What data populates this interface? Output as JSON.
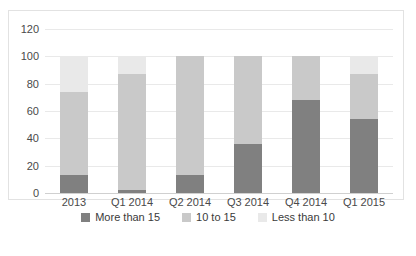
{
  "chart_data": {
    "type": "bar",
    "stacked": true,
    "title": "",
    "subtitle": "",
    "xlabel": "",
    "ylabel": "",
    "categories": [
      "2013",
      "Q1 2014",
      "Q2 2014",
      "Q3 2014",
      "Q4 2014",
      "Q1 2015"
    ],
    "series": [
      {
        "name": "More than 15",
        "color": "#808080",
        "values": [
          13,
          2,
          13,
          36,
          68,
          54
        ]
      },
      {
        "name": "10 to 15",
        "color": "#c9c9c9",
        "values": [
          61,
          85,
          87,
          64,
          32,
          33
        ]
      },
      {
        "name": "Less than 10",
        "color": "#e9e9e9",
        "values": [
          26,
          13,
          0,
          0,
          0,
          13
        ]
      }
    ],
    "ylim": [
      0,
      120
    ],
    "yticks": [
      0,
      20,
      40,
      60,
      80,
      100,
      120
    ],
    "ytick_labels": [
      "0",
      "20",
      "40",
      "60",
      "80",
      "100",
      "120"
    ],
    "grid": true,
    "grid_axis": "y",
    "legend_position": "bottom",
    "stack_totals": [
      100,
      100,
      100,
      100,
      100,
      100
    ]
  },
  "axis": {
    "y_labels": [
      "120",
      "100",
      "80",
      "60",
      "40",
      "20",
      "0"
    ]
  },
  "legend": {
    "items": [
      {
        "label": "More than 15",
        "color": "#808080"
      },
      {
        "label": "10 to 15",
        "color": "#c9c9c9"
      },
      {
        "label": "Less than 10",
        "color": "#e9e9e9"
      }
    ]
  }
}
